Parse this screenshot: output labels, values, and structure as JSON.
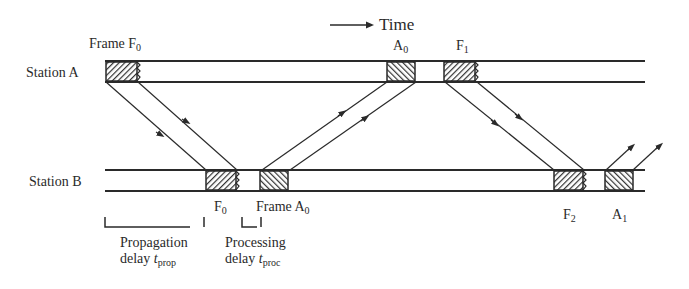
{
  "diagram": {
    "time_label": "Time",
    "stations": [
      {
        "name": "Station A"
      },
      {
        "name": "Station B"
      }
    ],
    "frame_labels": {
      "frame_f0_top": {
        "prefix": "Frame F",
        "sub": "0"
      },
      "a0_top": {
        "prefix": "A",
        "sub": "0"
      },
      "f1_top": {
        "prefix": "F",
        "sub": "1"
      },
      "f0_bottom": {
        "prefix": "F",
        "sub": "0"
      },
      "frame_a0_bottom": {
        "prefix": "Frame A",
        "sub": "0"
      },
      "f2_bottom": {
        "prefix": "F",
        "sub": "2"
      },
      "a1_bottom": {
        "prefix": "A",
        "sub": "1"
      }
    },
    "annotations": {
      "propagation": {
        "line1": "Propagation",
        "line2_prefix": "delay ",
        "var": "t",
        "sub": "prop"
      },
      "processing": {
        "line1": "Processing",
        "line2_prefix": "delay ",
        "var": "t",
        "sub": "proc"
      }
    },
    "colors": {
      "ink": "#2a2a2a",
      "hatch": "#3a3a3a",
      "background": "#ffffff"
    }
  }
}
